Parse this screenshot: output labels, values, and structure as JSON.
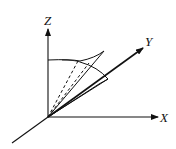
{
  "diagram": {
    "stroke_color": "#111111",
    "background": "#ffffff",
    "axes": {
      "z": {
        "label": "Z"
      },
      "y": {
        "label": "Y"
      },
      "x": {
        "label": "X"
      }
    }
  }
}
